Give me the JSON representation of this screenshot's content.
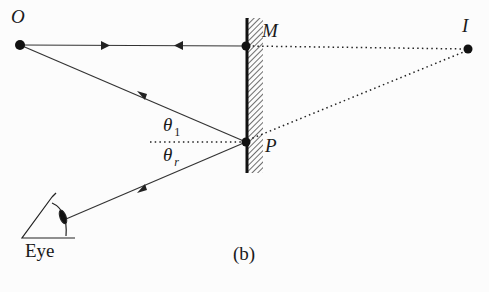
{
  "diagram": {
    "caption": "(b)",
    "points": {
      "O": {
        "label": "O",
        "x": 20,
        "y": 45
      },
      "M": {
        "label": "M",
        "x": 246,
        "y": 46
      },
      "I": {
        "label": "I",
        "x": 468,
        "y": 49
      },
      "P": {
        "label": "P",
        "x": 246,
        "y": 142
      }
    },
    "angles": {
      "incidence": {
        "symbol": "θ",
        "subscript": "1"
      },
      "reflection": {
        "symbol": "θ",
        "subscript": "r"
      }
    },
    "eye_label": "Eye",
    "mirror": {
      "x": 246,
      "y_top": 18,
      "y_bottom": 173,
      "hatch_side": "right"
    },
    "rays": [
      {
        "from": "O",
        "to": "M",
        "style": "solid",
        "arrows": [
          "forward"
        ]
      },
      {
        "from": "M",
        "to": "O",
        "style": "solid",
        "arrows": [
          "backward"
        ]
      },
      {
        "from": "O",
        "to": "P",
        "style": "solid",
        "arrows": [
          "forward"
        ]
      },
      {
        "from": "P",
        "to": "Eye",
        "style": "solid",
        "arrows": [
          "forward"
        ]
      },
      {
        "from": "M",
        "to": "I",
        "style": "dotted"
      },
      {
        "from": "P",
        "to": "I",
        "style": "dotted"
      },
      {
        "from": "normal_at_P",
        "to": "P",
        "style": "dotted"
      }
    ]
  }
}
